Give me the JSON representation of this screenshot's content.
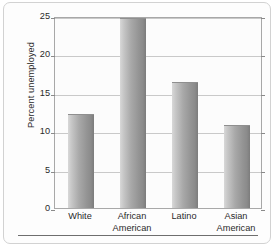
{
  "chart_data": {
    "type": "bar",
    "title": "",
    "subtitle": "",
    "xlabel": "",
    "ylabel": "Percent unemployed",
    "ylim": [
      0,
      25
    ],
    "ytick_values": [
      0,
      5,
      10,
      15,
      20,
      25
    ],
    "ytick_labels": [
      "0",
      "5",
      "10",
      "15",
      "20",
      "25"
    ],
    "grid": true,
    "legend": false,
    "legend_position": "none",
    "categories": [
      "White",
      "African American",
      "Latino",
      "Asian American"
    ],
    "category_lines": [
      [
        "White"
      ],
      [
        "African",
        "American"
      ],
      [
        "Latino"
      ],
      [
        "Asian",
        "American"
      ]
    ],
    "values": [
      12.2,
      24.7,
      16.4,
      10.8
    ],
    "bar_color": "#a0a0a0",
    "bar_edge_color": "#8f8f8f",
    "gridline_color": "#c9c9c9",
    "axis_color": "#a8a8a8",
    "plot_background": "#fcfcfc",
    "figure_background": "#fdfdfd",
    "text_color": "#2a2a2a"
  }
}
